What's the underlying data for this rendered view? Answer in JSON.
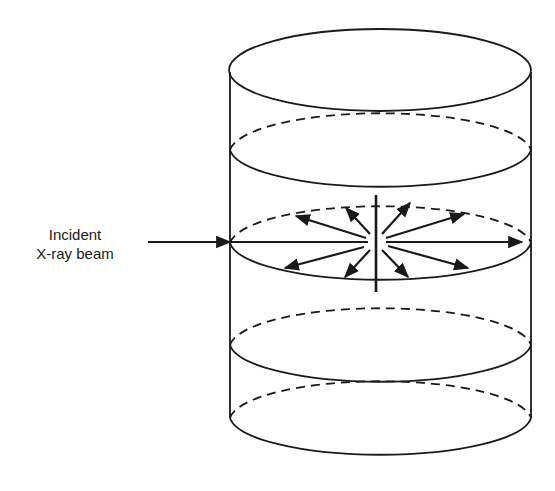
{
  "diagram": {
    "labels": {
      "incident_line1": "Incident",
      "incident_line2": "X-ray beam"
    },
    "colors": {
      "stroke": "#1a1a1a",
      "background": "#ffffff"
    },
    "elements": [
      "cylinder",
      "top-ellipse",
      "horizontal-slices",
      "incident-beam-arrow",
      "scattered-ray-arrows",
      "vertical-axis"
    ]
  }
}
